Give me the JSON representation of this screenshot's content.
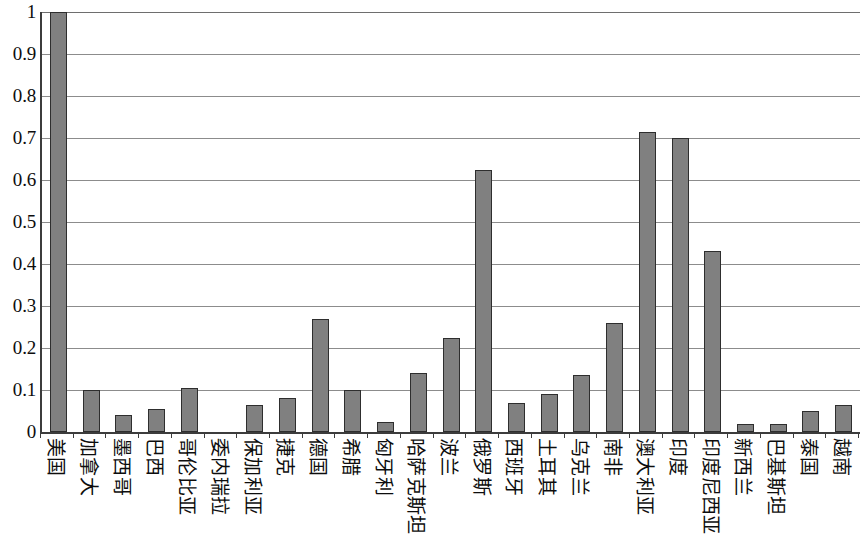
{
  "chart_data": {
    "type": "bar",
    "title": "",
    "subtitle": "",
    "xlabel": "",
    "ylabel": "",
    "ylim": [
      0,
      1
    ],
    "grid": true,
    "legend": "none",
    "y_ticks": [
      "0",
      "0.1",
      "0.2",
      "0.3",
      "0.4",
      "0.5",
      "0.6",
      "0.7",
      "0.8",
      "0.9",
      "1"
    ],
    "y_tick_values": [
      0,
      0.1,
      0.2,
      0.3,
      0.4,
      0.5,
      0.6,
      0.7,
      0.8,
      0.9,
      1
    ],
    "categories": [
      "美国",
      "加拿大",
      "墨西哥",
      "巴西",
      "哥伦比亚",
      "委内瑞拉",
      "保加利亚",
      "捷克",
      "德国",
      "希腊",
      "匈牙利",
      "哈萨克斯坦",
      "波兰",
      "俄罗斯",
      "西班牙",
      "土耳其",
      "乌克兰",
      "南非",
      "澳大利亚",
      "印度",
      "印度尼西亚",
      "新西兰",
      "巴基斯坦",
      "泰国",
      "越南"
    ],
    "values": [
      1.0,
      0.1,
      0.04,
      0.055,
      0.105,
      0.0,
      0.065,
      0.08,
      0.27,
      0.1,
      0.025,
      0.14,
      0.225,
      0.625,
      0.07,
      0.09,
      0.135,
      0.26,
      0.715,
      0.7,
      0.43,
      0.02,
      0.02,
      0.05,
      0.065
    ],
    "colors": {
      "bar_fill": "#808080",
      "bar_border": "#2e2e2e",
      "gridline": "#8c8c8c",
      "axis": "#3c3c3c",
      "background": "#ffffff",
      "text": "#0d0d0d"
    }
  }
}
